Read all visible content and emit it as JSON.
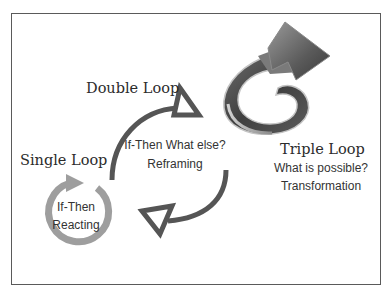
{
  "diagram": {
    "type": "learning-loops",
    "loops": [
      {
        "id": "single",
        "title": "Single Loop",
        "line1": "If-Then",
        "line2": "Reacting"
      },
      {
        "id": "double",
        "title": "Double Loop",
        "line1": "If-Then What else?",
        "line2": "Reframing"
      },
      {
        "id": "triple",
        "title": "Triple Loop",
        "line1": "What is possible?",
        "line2": "Transformation"
      }
    ],
    "colors": {
      "single_loop": "#9e9e9e",
      "double_loop": "#555555",
      "triple_arrow_dark": "#4a4a4a",
      "triple_arrow_light": "#b8b8b8",
      "frame": "#5a5a5a",
      "text": "#2b2b2b"
    }
  }
}
